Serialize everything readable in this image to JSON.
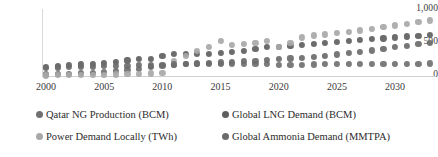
{
  "chart_data": {
    "type": "scatter",
    "title": "",
    "xlabel": "",
    "ylabel": "",
    "xlim": [
      1999.5,
      2033.5
    ],
    "ylim": [
      0,
      1000
    ],
    "grid": false,
    "legend_position": "bottom",
    "ytick_labels": [
      "1,000",
      "500",
      "0"
    ],
    "ytick_values": [
      1000,
      500,
      0
    ],
    "xtick_labels": [
      "2000",
      "2005",
      "2010",
      "2015",
      "2020",
      "2025",
      "2030"
    ],
    "xtick_values": [
      2000,
      2005,
      2010,
      2015,
      2020,
      2025,
      2030
    ],
    "x": [
      2000,
      2001,
      2002,
      2003,
      2004,
      2005,
      2006,
      2007,
      2008,
      2009,
      2010,
      2011,
      2012,
      2013,
      2014,
      2015,
      2016,
      2017,
      2018,
      2019,
      2020,
      2021,
      2022,
      2023,
      2024,
      2025,
      2026,
      2027,
      2028,
      2029,
      2030,
      2031,
      2032,
      2033
    ],
    "series": [
      {
        "name": "Qatar NG Production (BCM)",
        "color": "#707070",
        "unit": "BCM",
        "values": [
          24,
          30,
          36,
          44,
          52,
          60,
          72,
          86,
          110,
          130,
          150,
          168,
          175,
          178,
          180,
          182,
          181,
          180,
          178,
          178,
          171,
          168,
          170,
          172,
          175,
          178,
          180,
          182,
          183,
          184,
          185,
          186,
          186,
          187
        ]
      },
      {
        "name": "Global LNG Demand (BCM)",
        "color": "#5f5f5f",
        "unit": "BCM",
        "values": [
          140,
          150,
          160,
          172,
          185,
          200,
          215,
          232,
          250,
          258,
          298,
          325,
          330,
          325,
          335,
          340,
          355,
          370,
          400,
          430,
          430,
          455,
          470,
          485,
          495,
          510,
          520,
          535,
          548,
          562,
          575,
          590,
          600,
          612
        ]
      },
      {
        "name": "Power Demand Locally (TWh)",
        "color": "#a8a8a8",
        "unit": "TWh",
        "values": [
          9,
          11,
          13,
          15,
          18,
          21,
          24,
          28,
          33,
          38,
          44,
          230,
          300,
          370,
          440,
          520,
          470,
          480,
          495,
          525,
          440,
          500,
          575,
          605,
          620,
          640,
          660,
          680,
          700,
          730,
          755,
          780,
          805,
          830
        ]
      },
      {
        "name": "Global Ammonia Demand (MMTPA)",
        "color": "#6b6b6b",
        "unit": "MMTPA",
        "values": [
          125,
          128,
          132,
          136,
          140,
          145,
          150,
          156,
          162,
          158,
          165,
          172,
          180,
          188,
          196,
          204,
          212,
          220,
          230,
          240,
          250,
          262,
          275,
          290,
          305,
          322,
          340,
          360,
          382,
          405,
          430,
          455,
          480,
          500
        ]
      }
    ]
  },
  "legend": {
    "items": [
      {
        "label": "Qatar NG Production (BCM)",
        "color": "#707070"
      },
      {
        "label": "Global LNG Demand (BCM)",
        "color": "#5f5f5f"
      },
      {
        "label": "Power Demand Locally (TWh)",
        "color": "#a8a8a8"
      },
      {
        "label": "Global Ammonia Demand (MMTPA)",
        "color": "#6b6b6b"
      }
    ]
  }
}
